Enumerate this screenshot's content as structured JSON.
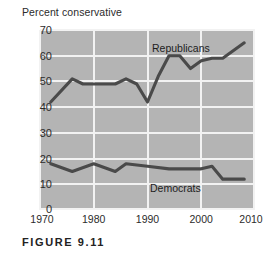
{
  "caption": "FIGURE 9.11",
  "chart_data": {
    "type": "line",
    "title": "",
    "ylabel": "Percent conservative",
    "xlabel": "",
    "ylim": [
      0,
      70
    ],
    "xlim": [
      1970,
      2010
    ],
    "yticks": [
      0,
      10,
      20,
      30,
      40,
      50,
      60,
      70
    ],
    "xticks": [
      1970,
      1980,
      1990,
      2000,
      2010
    ],
    "ytick_labels": [
      "0",
      "10",
      "20",
      "30",
      "40",
      "50",
      "60",
      "70"
    ],
    "xtick_labels": [
      "1970",
      "1980",
      "1990",
      "2000",
      "2010"
    ],
    "grid": true,
    "legend": "inline-labels",
    "plot_background": "#b4b4b4",
    "grid_color": "#f2f2f2",
    "line_color": "#4a4a4a",
    "series": [
      {
        "name": "Republicans",
        "label_position": "above-line-right-of-center",
        "x": [
          1972,
          1976,
          1978,
          1980,
          1984,
          1986,
          1988,
          1990,
          1992,
          1994,
          1996,
          1998,
          2000,
          2002,
          2004,
          2008
        ],
        "values": [
          42,
          51,
          49,
          49,
          49,
          51,
          49,
          42,
          52,
          60,
          60,
          55,
          58,
          59,
          59,
          65
        ]
      },
      {
        "name": "Democrats",
        "label_position": "below-line-right-of-center",
        "x": [
          1972,
          1976,
          1980,
          1984,
          1986,
          1990,
          1994,
          1998,
          2000,
          2002,
          2004,
          2008
        ],
        "values": [
          18,
          15,
          18,
          15,
          18,
          17,
          16,
          16,
          16,
          17,
          12,
          12
        ]
      }
    ]
  }
}
